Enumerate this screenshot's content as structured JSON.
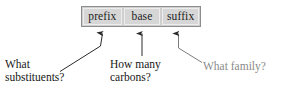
{
  "diagram": {
    "name_box": {
      "cells": [
        {
          "id": "prefix",
          "label": "prefix"
        },
        {
          "id": "base",
          "label": "base"
        },
        {
          "id": "suffix",
          "label": "suffix"
        }
      ],
      "fill_color": "#d6d6d6",
      "border_color": "#8d8d8d"
    },
    "callouts": [
      {
        "id": "substituents",
        "points_to": "prefix",
        "line1": "What",
        "line2": "substituents?",
        "text_color": "#171717"
      },
      {
        "id": "carbons",
        "points_to": "base",
        "line1": "How many",
        "line2": "carbons?",
        "text_color": "#171717"
      },
      {
        "id": "family",
        "points_to": "suffix",
        "line1": "What family?",
        "line2": "",
        "text_color": "#8a8a8a"
      }
    ],
    "background_color": "#ffffff",
    "arrow_color": "#2a2a2a"
  }
}
